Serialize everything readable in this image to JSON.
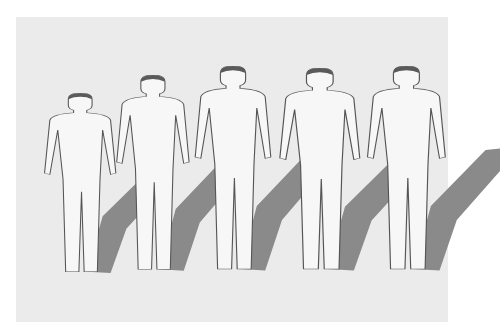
{
  "illustration": {
    "description": "Five faceless standing figures shown side by side, increasing in height from left to right, each casting a diagonal gray shadow",
    "background_color": "#ebebeb",
    "figure_fill": "#f7f7f7",
    "figure_outline": "#555555",
    "hair_color": "#5a5a5a",
    "shadow_color": "#8a8a8a",
    "figures": [
      {
        "stage": 1,
        "x": 34,
        "top": 93,
        "height": 185,
        "width": 62
      },
      {
        "stage": 2,
        "x": 106,
        "top": 75,
        "height": 201,
        "width": 64
      },
      {
        "stage": 3,
        "x": 184,
        "top": 66,
        "height": 210,
        "width": 70
      },
      {
        "stage": 4,
        "x": 268,
        "top": 68,
        "height": 208,
        "width": 78
      },
      {
        "stage": 5,
        "x": 356,
        "top": 66,
        "height": 210,
        "width": 74
      }
    ]
  }
}
